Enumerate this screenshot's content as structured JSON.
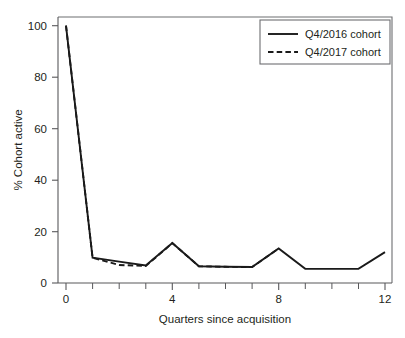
{
  "chart_data": {
    "type": "line",
    "title": "",
    "subtitle": "",
    "xlabel": "Quarters since acquisition",
    "ylabel": "% Cohort active",
    "x": [
      0,
      1,
      2,
      3,
      4,
      5,
      6,
      7,
      8,
      9,
      10,
      11,
      12
    ],
    "xlim": [
      0,
      12
    ],
    "ylim": [
      0,
      100
    ],
    "x_ticks_major": [
      0,
      4,
      8,
      12
    ],
    "x_tick_labels": [
      "0",
      "4",
      "8",
      "12"
    ],
    "x_ticks_minor": [
      1,
      2,
      3,
      5,
      6,
      7,
      9,
      10,
      11
    ],
    "y_ticks": [
      0,
      20,
      40,
      60,
      80,
      100
    ],
    "y_tick_labels": [
      "0",
      "20",
      "40",
      "60",
      "80",
      "100"
    ],
    "grid": false,
    "legend_position": "top-right",
    "series": [
      {
        "name": "Q4/2016 cohort",
        "style": "solid",
        "color": "#1a1a1a",
        "x": [
          0,
          1,
          2,
          3,
          4,
          5,
          6,
          7,
          8,
          9,
          10,
          11,
          12
        ],
        "values": [
          100,
          9.8,
          8.3,
          6.8,
          15.5,
          6.5,
          6.3,
          6.2,
          13.4,
          5.5,
          5.5,
          5.5,
          12.0
        ]
      },
      {
        "name": "Q4/2017 cohort",
        "style": "dashed",
        "color": "#1a1a1a",
        "x": [
          0,
          1,
          2,
          3,
          4,
          5,
          6,
          7,
          8
        ],
        "values": [
          100,
          9.8,
          7.0,
          6.6,
          15.5,
          6.5,
          6.3,
          6.2,
          13.4
        ]
      }
    ]
  },
  "legend": {
    "entries": [
      {
        "label": "Q4/2016 cohort",
        "style": "solid"
      },
      {
        "label": "Q4/2017 cohort",
        "style": "dashed"
      }
    ]
  },
  "axes": {
    "y_title": "% Cohort active",
    "x_title": "Quarters since acquisition",
    "y_labels": [
      "100",
      "80",
      "60",
      "40",
      "20",
      "0"
    ],
    "x_labels": [
      "0",
      "4",
      "8",
      "12"
    ]
  },
  "colors": {
    "background": "#ffffff",
    "line": "#1a1a1a",
    "axis": "#58585b",
    "frame": "#6d6e71",
    "text": "#231f20"
  }
}
